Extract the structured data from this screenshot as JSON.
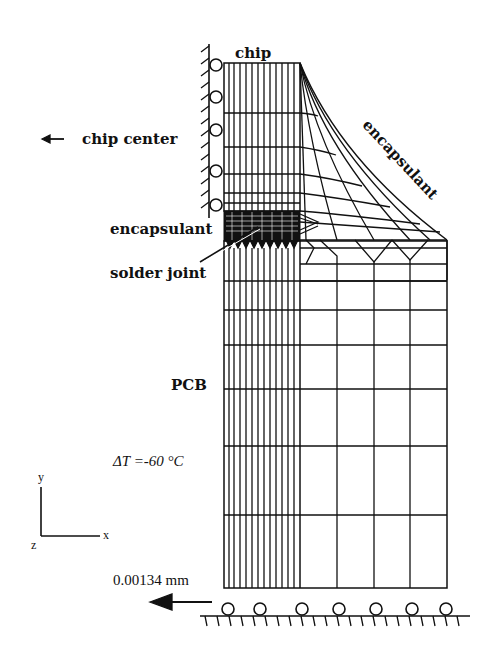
{
  "figure": {
    "labels": {
      "chip": "chip",
      "chip_center": "chip center",
      "encapsulant_top": "encapsulant",
      "encapsulant_left": "encapsulant",
      "solder_joint": "solder joint",
      "pcb": "PCB",
      "delta_t": "ΔT =-60 °C",
      "displacement": "0.00134 mm"
    },
    "axes": {
      "y": "y",
      "x": "x",
      "z": "z"
    },
    "arrows": {
      "chip_center": "left-arrow",
      "displacement": "left-arrow"
    },
    "boundary_conditions": {
      "left_edge": "roller-supports-symmetry",
      "bottom_edge": "roller-supports-fixed-ground"
    },
    "colors": {
      "line": "#111111",
      "background": "#ffffff"
    }
  }
}
